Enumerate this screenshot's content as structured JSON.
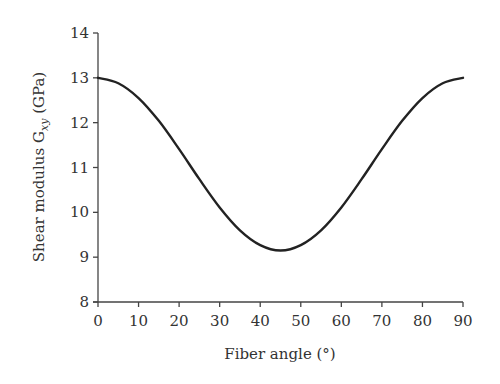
{
  "chart_data": {
    "type": "line",
    "title": "",
    "xlabel": "Fiber angle (°)",
    "ylabel": "Shear modulus G_xy (GPa)",
    "ylabel_parts": {
      "pre": "Shear modulus G",
      "sub": "xy",
      "post": " (GPa)"
    },
    "xlim": [
      0,
      90
    ],
    "ylim": [
      8,
      14
    ],
    "xticks": [
      0,
      10,
      20,
      30,
      40,
      50,
      60,
      70,
      80,
      90
    ],
    "yticks": [
      8,
      9,
      10,
      11,
      12,
      13,
      14
    ],
    "grid": false,
    "legend": null,
    "series": [
      {
        "name": "G_xy",
        "color": "#222222",
        "x": [
          0,
          5,
          10,
          15,
          20,
          25,
          30,
          35,
          40,
          45,
          50,
          55,
          60,
          65,
          70,
          75,
          80,
          85,
          90
        ],
        "y": [
          13.0,
          12.88,
          12.55,
          12.04,
          11.41,
          10.74,
          10.11,
          9.6,
          9.27,
          9.15,
          9.27,
          9.6,
          10.11,
          10.74,
          11.41,
          12.04,
          12.55,
          12.88,
          13.0
        ]
      }
    ]
  }
}
